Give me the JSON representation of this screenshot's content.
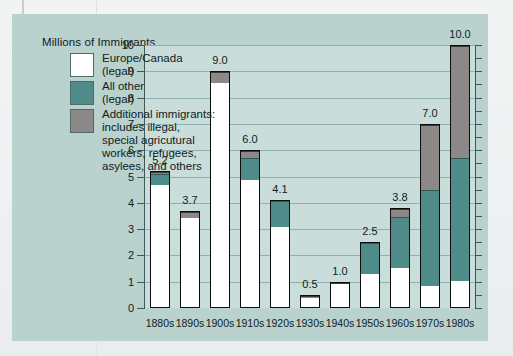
{
  "chart_data": {
    "type": "bar",
    "title": "Millions of Immigrants",
    "xlabel": "",
    "ylabel": "Millions of Immigrants",
    "ylim": [
      0,
      10
    ],
    "ytick_labels": [
      "0",
      "1",
      "2",
      "3",
      "4",
      "5",
      "6",
      "7",
      "8",
      "9",
      "10"
    ],
    "grid": true,
    "legend_position": "upper-left-inside",
    "stacked": true,
    "categories": [
      "1880s",
      "1890s",
      "1900s",
      "1910s",
      "1920s",
      "1930s",
      "1940s",
      "1950s",
      "1960s",
      "1970s",
      "1980s"
    ],
    "totals": [
      5.2,
      3.7,
      9.0,
      6.0,
      4.1,
      0.5,
      1.0,
      2.5,
      3.8,
      7.0,
      10.0
    ],
    "total_labels": [
      "5.2",
      "3.7",
      "9.0",
      "6.0",
      "4.1",
      "0.5",
      "1.0",
      "2.5",
      "3.8",
      "7.0",
      "10.0"
    ],
    "series": [
      {
        "name": "Europe/Canada (legal)",
        "color": "#ffffff",
        "values": [
          4.7,
          3.45,
          8.6,
          4.9,
          3.1,
          0.42,
          0.95,
          1.3,
          1.5,
          0.8,
          1.0
        ]
      },
      {
        "name": "All other (legal)",
        "color": "#4f8c89",
        "values": [
          0.45,
          0.0,
          0.0,
          0.85,
          1.0,
          0.0,
          0.0,
          1.2,
          2.0,
          3.7,
          4.7
        ]
      },
      {
        "name": "Additional immigrants: includes illegal, special agricultural workers, refugees, asylees, and others",
        "color": "#8d8888",
        "values": [
          0.05,
          0.25,
          0.4,
          0.25,
          0.0,
          0.08,
          0.05,
          0.0,
          0.3,
          2.5,
          4.3
        ]
      }
    ]
  },
  "legend": {
    "items": [
      {
        "swatch_name": "legend-swatch-europe-canada",
        "color": "#ffffff",
        "line1": "Europe/Canada",
        "line2": "(legal)"
      },
      {
        "swatch_name": "legend-swatch-all-other",
        "color": "#4f8c89",
        "line1": "All other",
        "line2": "(legal)"
      },
      {
        "swatch_name": "legend-swatch-additional",
        "color": "#8d8888",
        "line1": "Additional immigrants:",
        "line2": "includes illegal,",
        "line3": "special agricutural",
        "line4": "workers, refugees,",
        "line5": "asylees, and others"
      }
    ]
  },
  "colors": {
    "panel_background": "#b9d2ce",
    "plot_background": "#c9dedb",
    "gridline": "#8fb0ad",
    "axis": "#3d5a58",
    "bar_outline": "#0d0d0d",
    "text": "#10201f"
  }
}
